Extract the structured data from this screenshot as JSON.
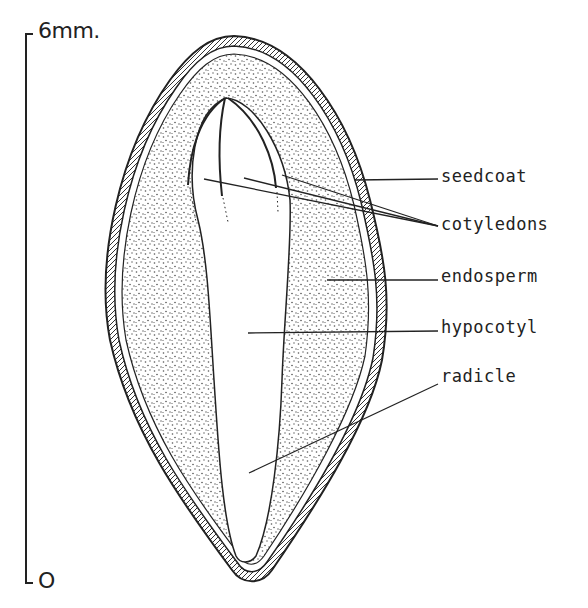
{
  "diagram": {
    "scale": {
      "top_label": "6mm.",
      "bottom_label": "O"
    },
    "labels": [
      {
        "id": "seedcoat",
        "text": "seedcoat"
      },
      {
        "id": "cotyledons",
        "text": "cotyledons"
      },
      {
        "id": "endosperm",
        "text": "endosperm"
      },
      {
        "id": "hypocotyl",
        "text": "hypocotyl"
      },
      {
        "id": "radicle",
        "text": "radicle"
      }
    ],
    "colors": {
      "ink": "#222222",
      "background": "#ffffff"
    }
  }
}
